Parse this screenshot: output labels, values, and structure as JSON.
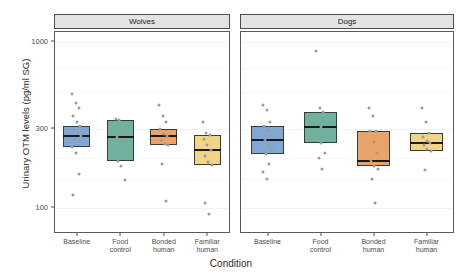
{
  "chart_data": {
    "type": "box",
    "title": "",
    "xlabel": "Condition",
    "ylabel": "Urinary OTM levels (pg/ml SG)",
    "yscale": "log",
    "ylim": [
      70,
      1150
    ],
    "yticks": [
      100,
      300,
      1000
    ],
    "ytick_labels": [
      "100",
      "300",
      "1000"
    ],
    "grid": true,
    "legend": "none",
    "facet_labels": [
      "Wolves",
      "Dogs"
    ],
    "categories": [
      "Baseline",
      "Food control",
      "Bonded human",
      "Familiar human"
    ],
    "category_labels": [
      "Baseline",
      "Food\ncontrol",
      "Bonded\nhuman",
      "Familiar\nhuman"
    ],
    "colors": [
      "#7FA8D4",
      "#6FB19C",
      "#E9A469",
      "#F0D684"
    ],
    "panels": [
      {
        "name": "Wolves",
        "boxes": [
          {
            "category": "Baseline",
            "color": "#7FA8D4",
            "lower": 233,
            "q1": 233,
            "median": 272,
            "q3": 312,
            "upper": 312,
            "points": [
              490,
              430,
              400,
              360,
              330,
              312,
              300,
              285,
              272,
              262,
              250,
              235,
              215,
              160,
              120
            ]
          },
          {
            "category": "Food control",
            "color": "#6FB19C",
            "lower": 192,
            "q1": 192,
            "median": 268,
            "q3": 340,
            "upper": 340,
            "points": [
              345,
              340,
              300,
              268,
              250,
              205,
              192,
              180,
              148
            ]
          },
          {
            "category": "Bonded human",
            "color": "#E9A469",
            "lower": 240,
            "q1": 240,
            "median": 272,
            "q3": 300,
            "upper": 300,
            "points": [
              420,
              360,
              330,
              300,
              280,
              272,
              258,
              245,
              240,
              185,
              110
            ]
          },
          {
            "category": "Familiar human",
            "color": "#F0D684",
            "lower": 182,
            "q1": 182,
            "median": 225,
            "q3": 275,
            "upper": 275,
            "points": [
              330,
              282,
              275,
              260,
              240,
              225,
              205,
              190,
              182,
              108,
              92
            ]
          }
        ]
      },
      {
        "name": "Dogs",
        "boxes": [
          {
            "category": "Baseline",
            "color": "#7FA8D4",
            "lower": 212,
            "q1": 212,
            "median": 258,
            "q3": 312,
            "upper": 312,
            "points": [
              420,
              390,
              330,
              312,
              295,
              272,
              258,
              240,
              225,
              212,
              185,
              165,
              150
            ]
          },
          {
            "category": "Food control",
            "color": "#6FB19C",
            "lower": 248,
            "q1": 248,
            "median": 310,
            "q3": 382,
            "upper": 382,
            "points": [
              880,
              400,
              382,
              340,
              310,
              295,
              265,
              248,
              215,
              200,
              172
            ]
          },
          {
            "category": "Bonded human",
            "color": "#E9A469",
            "lower": 180,
            "q1": 180,
            "median": 192,
            "q3": 290,
            "upper": 290,
            "points": [
              400,
              360,
              292,
              290,
              250,
              215,
              192,
              180,
              172,
              150,
              108
            ]
          },
          {
            "category": "Familiar human",
            "color": "#F0D684",
            "lower": 222,
            "q1": 222,
            "median": 248,
            "q3": 285,
            "upper": 285,
            "points": [
              400,
              330,
              285,
              268,
              255,
              248,
              240,
              228,
              222,
              170
            ]
          }
        ]
      }
    ]
  }
}
